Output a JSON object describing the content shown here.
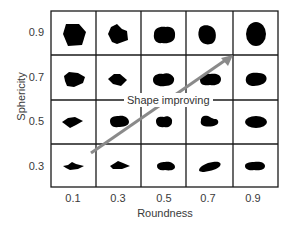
{
  "diagram": {
    "y_axis": {
      "label": "Sphericity",
      "ticks": [
        "0.9",
        "0.7",
        "0.5",
        "0.3"
      ]
    },
    "x_axis": {
      "label": "Roundness",
      "ticks": [
        "0.1",
        "0.3",
        "0.5",
        "0.7",
        "0.9"
      ]
    },
    "arrow": {
      "label": "Shape improving",
      "color": "#8a8a8a",
      "direction": "from low roundness/low sphericity to high roundness/high sphericity"
    },
    "grid": {
      "rows": 4,
      "columns": 5,
      "line_color": "#1a1a1a",
      "shape_color": "#000000",
      "cells": [
        {
          "sphericity": "0.9",
          "roundness": "0.1",
          "shape": "angular-pentagon-large"
        },
        {
          "sphericity": "0.9",
          "roundness": "0.3",
          "shape": "subangular-large"
        },
        {
          "sphericity": "0.9",
          "roundness": "0.5",
          "shape": "subrounded-large"
        },
        {
          "sphericity": "0.9",
          "roundness": "0.7",
          "shape": "rounded-large"
        },
        {
          "sphericity": "0.9",
          "roundness": "0.9",
          "shape": "well-rounded-oval-large"
        },
        {
          "sphericity": "0.7",
          "roundness": "0.1",
          "shape": "angular-medium"
        },
        {
          "sphericity": "0.7",
          "roundness": "0.3",
          "shape": "subangular-diamond"
        },
        {
          "sphericity": "0.7",
          "roundness": "0.5",
          "shape": "subrounded-medium"
        },
        {
          "sphericity": "0.7",
          "roundness": "0.7",
          "shape": "rounded-medium"
        },
        {
          "sphericity": "0.7",
          "roundness": "0.9",
          "shape": "well-rounded-medium"
        },
        {
          "sphericity": "0.5",
          "roundness": "0.1",
          "shape": "angular-flat"
        },
        {
          "sphericity": "0.5",
          "roundness": "0.3",
          "shape": "subangular-flat"
        },
        {
          "sphericity": "0.5",
          "roundness": "0.5",
          "shape": "subrounded-flat"
        },
        {
          "sphericity": "0.5",
          "roundness": "0.7",
          "shape": "rounded-flat"
        },
        {
          "sphericity": "0.5",
          "roundness": "0.9",
          "shape": "well-rounded-ellipse"
        },
        {
          "sphericity": "0.3",
          "roundness": "0.1",
          "shape": "angular-elongate"
        },
        {
          "sphericity": "0.3",
          "roundness": "0.3",
          "shape": "subangular-elongate"
        },
        {
          "sphericity": "0.3",
          "roundness": "0.5",
          "shape": "subrounded-elongate"
        },
        {
          "sphericity": "0.3",
          "roundness": "0.7",
          "shape": "rounded-elongate-tilted"
        },
        {
          "sphericity": "0.3",
          "roundness": "0.9",
          "shape": "well-rounded-elongate"
        }
      ]
    }
  }
}
